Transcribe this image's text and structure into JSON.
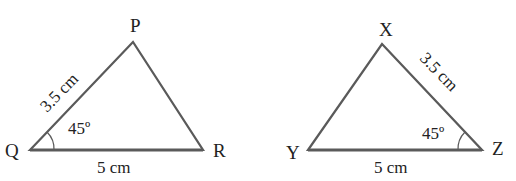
{
  "figure": {
    "stroke_color": "#5a5a5a",
    "text_color": "#222222",
    "triangle_left": {
      "vertices": {
        "P": "P",
        "Q": "Q",
        "R": "R"
      },
      "side_QP": "3.5 cm",
      "side_QR": "5 cm",
      "angle_Q": "45º"
    },
    "triangle_right": {
      "vertices": {
        "X": "X",
        "Y": "Y",
        "Z": "Z"
      },
      "side_XZ": "3.5 cm",
      "side_YZ": "5 cm",
      "angle_Z": "45º"
    }
  }
}
